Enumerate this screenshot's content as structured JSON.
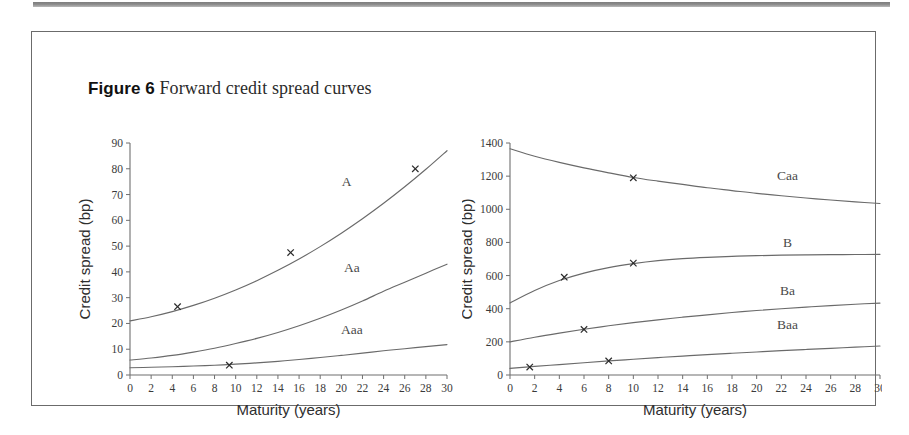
{
  "figure": {
    "label": "Figure 6",
    "title": "Forward credit spread curves"
  },
  "chart_data": [
    {
      "id": "investment-grade",
      "type": "line",
      "title": "",
      "xlabel": "Maturity (years)",
      "ylabel": "Credit spread (bp)",
      "xlim": [
        0,
        30
      ],
      "ylim": [
        0,
        90
      ],
      "xticks": [
        0,
        2,
        4,
        6,
        8,
        10,
        12,
        14,
        16,
        18,
        20,
        22,
        24,
        26,
        28,
        30
      ],
      "yticks": [
        0,
        10,
        20,
        30,
        40,
        50,
        60,
        70,
        80,
        90
      ],
      "grid": false,
      "legend_position": "inline-curve-labels",
      "series": [
        {
          "name": "A",
          "label_x": 20.5,
          "label_y": 73.5,
          "x": [
            0,
            2,
            4,
            6,
            8,
            10,
            12,
            14,
            16,
            18,
            20,
            22,
            24,
            26,
            28,
            30
          ],
          "values": [
            21.0,
            22.6,
            24.6,
            27.0,
            29.8,
            33.0,
            36.6,
            40.6,
            45.0,
            49.8,
            55.0,
            60.6,
            66.6,
            73.0,
            79.8,
            87.0
          ],
          "markers": [
            {
              "x": 4.5,
              "y": 26.5
            },
            {
              "x": 15.2,
              "y": 47.5
            },
            {
              "x": 27.0,
              "y": 80.0
            }
          ]
        },
        {
          "name": "Aa",
          "label_x": 21.0,
          "label_y": 40.0,
          "x": [
            0,
            2,
            4,
            6,
            8,
            10,
            12,
            14,
            16,
            18,
            20,
            22,
            24,
            26,
            28,
            30
          ],
          "values": [
            5.8,
            6.6,
            7.6,
            8.9,
            10.4,
            12.2,
            14.2,
            16.5,
            19.1,
            22.0,
            25.2,
            28.7,
            32.5,
            36.0,
            39.5,
            43.0
          ],
          "markers": []
        },
        {
          "name": "Aaa",
          "label_x": 21.0,
          "label_y": 16.0,
          "x": [
            0,
            2,
            4,
            6,
            8,
            10,
            12,
            14,
            16,
            18,
            20,
            22,
            24,
            26,
            28,
            30
          ],
          "values": [
            2.8,
            3.0,
            3.2,
            3.5,
            3.8,
            4.2,
            4.7,
            5.3,
            6.0,
            6.8,
            7.6,
            8.5,
            9.4,
            10.2,
            11.0,
            11.8
          ],
          "markers": [
            {
              "x": 9.4,
              "y": 3.8
            }
          ]
        }
      ]
    },
    {
      "id": "speculative-grade",
      "type": "line",
      "title": "",
      "xlabel": "Maturity (years)",
      "ylabel": "Credit spread (bp)",
      "xlim": [
        0,
        30
      ],
      "ylim": [
        0,
        1400
      ],
      "xticks": [
        0,
        2,
        4,
        6,
        8,
        10,
        12,
        14,
        16,
        18,
        20,
        22,
        24,
        26,
        28,
        30
      ],
      "yticks": [
        0,
        200,
        400,
        600,
        800,
        1000,
        1200,
        1400
      ],
      "grid": false,
      "legend_position": "inline-curve-labels",
      "series": [
        {
          "name": "Caa",
          "label_x": 22.5,
          "label_y": 1175,
          "x": [
            0,
            2,
            4,
            6,
            8,
            10,
            12,
            14,
            16,
            18,
            20,
            22,
            24,
            26,
            28,
            30
          ],
          "values": [
            1365,
            1320,
            1283,
            1250,
            1220,
            1192,
            1170,
            1150,
            1130,
            1113,
            1096,
            1082,
            1068,
            1056,
            1045,
            1035
          ],
          "markers": [
            {
              "x": 10.0,
              "y": 1190
            }
          ]
        },
        {
          "name": "B",
          "label_x": 22.5,
          "label_y": 775,
          "x": [
            0,
            2,
            4,
            6,
            8,
            10,
            12,
            14,
            16,
            18,
            20,
            22,
            24,
            26,
            28,
            30
          ],
          "values": [
            435,
            510,
            570,
            615,
            648,
            672,
            690,
            702,
            710,
            716,
            720,
            723,
            725,
            726,
            727,
            728
          ],
          "markers": [
            {
              "x": 4.4,
              "y": 590
            },
            {
              "x": 10.0,
              "y": 675
            }
          ]
        },
        {
          "name": "Ba",
          "label_x": 22.5,
          "label_y": 480,
          "x": [
            0,
            2,
            4,
            6,
            8,
            10,
            12,
            14,
            16,
            18,
            20,
            22,
            24,
            26,
            28,
            30
          ],
          "values": [
            200,
            228,
            253,
            276,
            297,
            316,
            333,
            349,
            363,
            377,
            389,
            400,
            410,
            419,
            427,
            434
          ],
          "markers": [
            {
              "x": 6.0,
              "y": 275
            }
          ]
        },
        {
          "name": "Baa",
          "label_x": 22.5,
          "label_y": 275,
          "x": [
            0,
            2,
            4,
            6,
            8,
            10,
            12,
            14,
            16,
            18,
            20,
            22,
            24,
            26,
            28,
            30
          ],
          "values": [
            40,
            52,
            63,
            74,
            85,
            95,
            105,
            114,
            123,
            131,
            139,
            147,
            154,
            161,
            168,
            175
          ],
          "markers": [
            {
              "x": 1.6,
              "y": 48
            },
            {
              "x": 8.0,
              "y": 85
            }
          ]
        }
      ]
    }
  ]
}
